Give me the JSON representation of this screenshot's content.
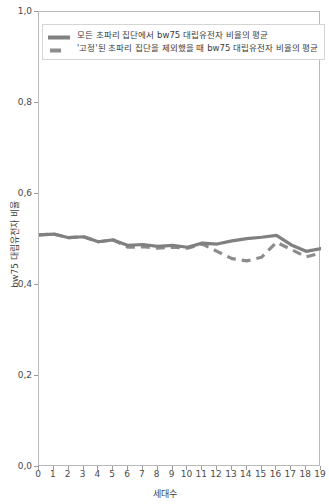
{
  "chart_data": {
    "type": "line",
    "title": "",
    "xlabel": "세대수",
    "ylabel": "bw75 대립유전자 비율",
    "xlim": [
      0,
      19
    ],
    "ylim": [
      0.0,
      1.0
    ],
    "grid": false,
    "legend_position": "upper left",
    "x": [
      0,
      1,
      2,
      3,
      4,
      5,
      6,
      7,
      8,
      9,
      10,
      11,
      12,
      13,
      14,
      15,
      16,
      17,
      18,
      19
    ],
    "xticklabels": [
      "0",
      "1",
      "2",
      "3",
      "4",
      "5",
      "6",
      "7",
      "8",
      "9",
      "10",
      "11",
      "12",
      "13",
      "14",
      "15",
      "16",
      "17",
      "18",
      "19"
    ],
    "yticks": [
      0.0,
      0.2,
      0.4,
      0.6,
      0.8,
      1.0
    ],
    "yticklabels": [
      "0,0",
      "0,2",
      "0,4",
      "0,6",
      "0,8",
      "1,0"
    ],
    "series": [
      {
        "name": "모든 초파리 집단에서 bw75 대립유전자 비율의 평균",
        "style": "solid",
        "color": "#808080",
        "values": [
          0.51,
          0.512,
          0.504,
          0.506,
          0.495,
          0.499,
          0.487,
          0.489,
          0.485,
          0.487,
          0.483,
          0.492,
          0.49,
          0.497,
          0.502,
          0.505,
          0.509,
          0.488,
          0.474,
          0.48
        ]
      },
      {
        "name": "'고정'된 초파리 집단을 제외했을 때 bw75 대립유전자 비율의 평균",
        "style": "dashed",
        "color": "#8c8c8c",
        "values": [
          0.51,
          0.512,
          0.504,
          0.506,
          0.495,
          0.499,
          0.483,
          0.484,
          0.481,
          0.483,
          0.481,
          0.49,
          0.474,
          0.458,
          0.453,
          0.461,
          0.494,
          0.478,
          0.462,
          0.47
        ]
      }
    ]
  },
  "axes": {
    "y_tick_labels": [
      "1,0",
      "0,8",
      "0,6",
      "0,4",
      "0,2",
      "0,0"
    ],
    "y_tick_values": [
      1.0,
      0.8,
      0.6,
      0.4,
      0.2,
      0.0
    ],
    "x_tick_labels": [
      "0",
      "1",
      "2",
      "3",
      "4",
      "5",
      "6",
      "7",
      "8",
      "9",
      "10",
      "11",
      "12",
      "13",
      "14",
      "15",
      "16",
      "17",
      "18",
      "19"
    ],
    "y_axis_title": "bw75 대립유전자 비율",
    "x_axis_title": "세대수"
  },
  "legend": {
    "entries": [
      {
        "label": "모든 초파리 집단에서 bw75 대립유전자 비율의 평균",
        "style": "solid",
        "color": "#808080"
      },
      {
        "label": "'고정'된 초파리 집단을 제외했을 때 bw75 대립유전자 비율의 평균",
        "style": "dashed",
        "color": "#8c8c8c"
      }
    ]
  },
  "colors": {
    "frame": "#b9b9b9",
    "tick": "#9b9b9b",
    "text": "#3a3a3a",
    "background": "#ffffff",
    "series_solid": "#808080",
    "series_dashed": "#8c8c8c"
  }
}
